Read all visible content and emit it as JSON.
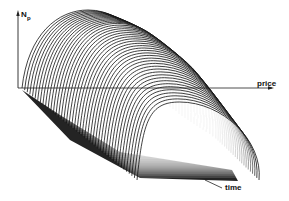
{
  "chart_data": {
    "type": "surface3d",
    "title": "",
    "axes": {
      "vertical": {
        "label": "N",
        "subscript": "p"
      },
      "x": {
        "label": "price"
      },
      "depth": {
        "label": "time"
      }
    },
    "n_slices": 45,
    "grid": false,
    "colors": {
      "line": "#111111",
      "background": "#ffffff"
    }
  },
  "labels": {
    "y_axis": "N",
    "y_axis_sub": "p",
    "x_axis": "price",
    "time_axis": "time"
  }
}
